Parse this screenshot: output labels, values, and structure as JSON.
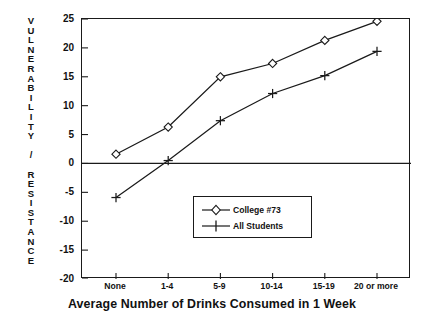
{
  "chart_data": {
    "type": "line",
    "title": "",
    "xlabel": "Average Number of Drinks Consumed in 1 Week",
    "ylabel": "VULNERABILITY / RESISTANCE",
    "categories": [
      "None",
      "1-4",
      "5-9",
      "10-14",
      "15-19",
      "20 or more"
    ],
    "series": [
      {
        "name": "College #73",
        "marker": "diamond",
        "values": [
          1.6,
          6.3,
          15.0,
          17.3,
          21.3,
          24.6
        ]
      },
      {
        "name": "All Students",
        "marker": "plus",
        "values": [
          -5.9,
          0.5,
          7.4,
          12.1,
          15.2,
          19.4
        ]
      }
    ],
    "ylim": [
      -20,
      25
    ],
    "yticks": [
      25,
      20,
      15,
      10,
      5,
      0,
      -5,
      -10,
      -15,
      -20
    ],
    "ytick_labels": [
      "25",
      "20",
      "15",
      "10",
      "5",
      "0",
      "-5",
      "-10",
      "-15",
      "-20"
    ],
    "grid": false,
    "zero_line": 0,
    "legend_position": "bottom-right",
    "line_color": "#1a1a1a"
  },
  "ylabel_letters": [
    "V",
    "U",
    "L",
    "N",
    "E",
    "R",
    "A",
    "B",
    "I",
    "L",
    "I",
    "T",
    "Y",
    "",
    "/",
    "",
    "R",
    "E",
    "S",
    "I",
    "S",
    "T",
    "A",
    "N",
    "C",
    "E"
  ],
  "legend": {
    "items": [
      {
        "label": "College #73",
        "marker": "diamond"
      },
      {
        "label": "All Students",
        "marker": "plus"
      }
    ]
  }
}
